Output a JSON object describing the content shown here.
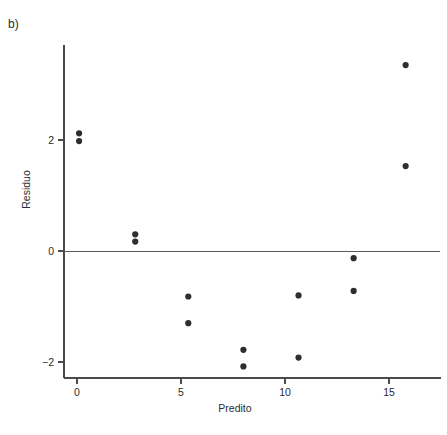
{
  "figure": {
    "panel_label": "b)",
    "background_color": "#ffffff",
    "point_color": "#2e2e2e",
    "axis_color": "#4a4a4a"
  },
  "chart_data": {
    "type": "scatter",
    "title": "",
    "xlabel": "Predito",
    "ylabel": "Residuo",
    "xlim": [
      -1.2,
      17.5
    ],
    "ylim": [
      -2.6,
      3.6
    ],
    "xticks": [
      0,
      5,
      10,
      15
    ],
    "xticklabels": [
      "0",
      "5",
      "10",
      "15"
    ],
    "yticks": [
      -2,
      0,
      2
    ],
    "yticklabels": [
      "−2",
      "0",
      "2"
    ],
    "grid": false,
    "legend": null,
    "reference_lines": [
      {
        "orientation": "horizontal",
        "value": 0
      }
    ],
    "points": [
      {
        "x": 0.1,
        "y": 2.12
      },
      {
        "x": 0.1,
        "y": 1.98
      },
      {
        "x": 2.8,
        "y": 0.3
      },
      {
        "x": 2.8,
        "y": 0.17
      },
      {
        "x": 5.35,
        "y": -0.82
      },
      {
        "x": 5.35,
        "y": -1.3
      },
      {
        "x": 8.0,
        "y": -1.78
      },
      {
        "x": 8.0,
        "y": -2.08
      },
      {
        "x": 10.65,
        "y": -0.8
      },
      {
        "x": 10.65,
        "y": -1.92
      },
      {
        "x": 13.3,
        "y": -0.13
      },
      {
        "x": 13.3,
        "y": -0.72
      },
      {
        "x": 15.8,
        "y": 3.35
      },
      {
        "x": 15.8,
        "y": 1.53
      }
    ]
  }
}
